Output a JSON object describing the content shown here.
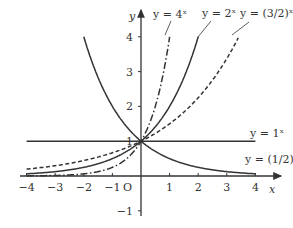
{
  "chart_data": {
    "type": "line",
    "title": "",
    "xlabel": "x",
    "ylabel": "y",
    "origin_label": "O",
    "xlim": [
      -4,
      4
    ],
    "ylim": [
      -1,
      4
    ],
    "x_ticks": [
      -4,
      -3,
      -2,
      -1,
      1,
      2,
      3,
      4
    ],
    "y_ticks": [
      -1,
      1,
      2,
      3,
      4
    ],
    "grid": false,
    "legend": "inline labels",
    "series": [
      {
        "name": "y = 4^x",
        "label": "y = 4ˣ",
        "base": 4,
        "style": "dash-dot",
        "x_range": [
          -4,
          1
        ]
      },
      {
        "name": "y = 2^x",
        "label": "y = 2ˣ",
        "base": 2,
        "style": "solid",
        "x_range": [
          -4,
          2
        ]
      },
      {
        "name": "y = (3/2)^x",
        "label": "y = (3/2)ˣ",
        "base": 1.5,
        "style": "dashed",
        "x_range": [
          -4,
          3.4
        ]
      },
      {
        "name": "y = 1^x",
        "label": "y = 1ˣ",
        "base": 1,
        "style": "solid",
        "x_range": [
          -4,
          4
        ]
      },
      {
        "name": "y = (1/2)^x",
        "label": "y = (1/2)ˣ",
        "base": 0.5,
        "style": "solid",
        "x_range": [
          -2,
          4
        ]
      }
    ],
    "colors": {
      "axis": "#333333",
      "curve": "#333333",
      "background": "#ffffff"
    }
  }
}
